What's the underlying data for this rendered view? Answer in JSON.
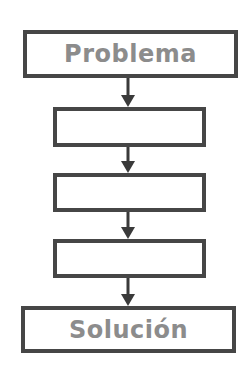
{
  "diagram": {
    "type": "flowchart",
    "direction": "top-to-bottom",
    "colors": {
      "border": "#464646",
      "arrow": "#3a3a3a",
      "label": "#8c8c8c",
      "background": "#ffffff"
    },
    "nodes": [
      {
        "id": "start",
        "label": "Problema"
      },
      {
        "id": "step1",
        "label": ""
      },
      {
        "id": "step2",
        "label": ""
      },
      {
        "id": "step3",
        "label": ""
      },
      {
        "id": "end",
        "label": "Solución"
      }
    ],
    "edges": [
      {
        "from": "start",
        "to": "step1"
      },
      {
        "from": "step1",
        "to": "step2"
      },
      {
        "from": "step2",
        "to": "step3"
      },
      {
        "from": "step3",
        "to": "end"
      }
    ]
  }
}
